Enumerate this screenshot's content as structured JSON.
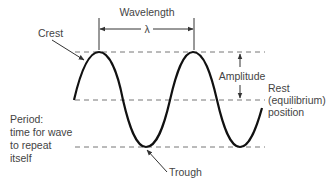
{
  "diagram": {
    "labels": {
      "wavelength": "Wavelength",
      "lambda": "λ",
      "crest": "Crest",
      "amplitude": "Amplitude",
      "rest_line1": "Rest",
      "rest_line2": "(equilibrium)",
      "rest_line3": "position",
      "period_line1": "Period:",
      "period_line2": "time for wave",
      "period_line3": "to repeat",
      "period_line4": "itself",
      "trough": "Trough"
    },
    "colors": {
      "wave": "#111111",
      "guides": "#777777",
      "text": "#444444",
      "background": "#ffffff"
    }
  }
}
